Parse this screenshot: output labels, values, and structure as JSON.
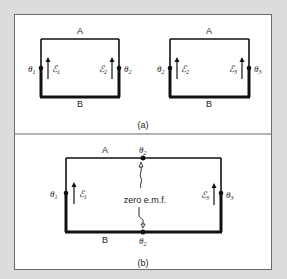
{
  "figure": {
    "panels": [
      {
        "id": "a",
        "caption": "(a)",
        "circuits": [
          {
            "top_label": "A",
            "bottom_label": "B",
            "left_junction": "θ",
            "left_junction_sub": "1",
            "left_emf": "ℰ",
            "left_emf_sub": "1",
            "right_emf": "ℰ",
            "right_emf_sub": "2",
            "right_junction": "θ",
            "right_junction_sub": "2"
          },
          {
            "top_label": "A",
            "bottom_label": "B",
            "left_junction": "θ",
            "left_junction_sub": "2",
            "left_emf": "ℰ",
            "left_emf_sub": "2",
            "right_emf": "ℰ",
            "right_emf_sub": "3",
            "right_junction": "θ",
            "right_junction_sub": "3"
          }
        ]
      },
      {
        "id": "b",
        "caption": "(b)",
        "circuit": {
          "top_label": "A",
          "bottom_label": "B",
          "top_mid_junction": "θ",
          "top_mid_junction_sub": "2",
          "bottom_mid_junction": "θ",
          "bottom_mid_junction_sub": "2",
          "left_junction": "θ",
          "left_junction_sub": "1",
          "left_emf": "ℰ",
          "left_emf_sub": "1",
          "right_emf": "ℰ",
          "right_emf_sub": "3",
          "right_junction": "θ",
          "right_junction_sub": "3",
          "annotation": "zero e.m.f."
        }
      }
    ],
    "colors": {
      "frame": "#dcdcdc",
      "panel": "#ffffff",
      "wire": "#111111",
      "border": "#6a6a6a"
    }
  }
}
